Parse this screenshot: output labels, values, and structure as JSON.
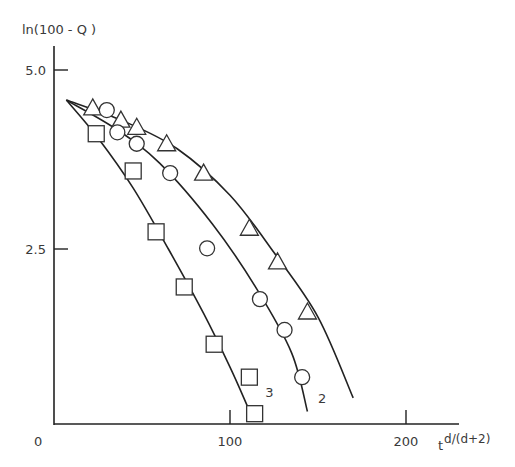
{
  "chart_data": {
    "type": "scatter",
    "title": "",
    "ylabel": "ln(100 - Q )",
    "xlabel": "t",
    "xlabel_superscript": "d/(d+2)",
    "xlim": [
      0,
      230
    ],
    "ylim": [
      0,
      5.3
    ],
    "x_ticks": [
      {
        "value": 0,
        "label": "0"
      },
      {
        "value": 100,
        "label": "100"
      },
      {
        "value": 200,
        "label": "200"
      }
    ],
    "y_ticks": [
      {
        "value": 2.5,
        "label": "2.5"
      },
      {
        "value": 5.0,
        "label": "5.0"
      }
    ],
    "grid": false,
    "legend": "none (curves labeled inline)",
    "series": [
      {
        "name": "1",
        "marker": "triangle",
        "label": "",
        "points": [
          [
            22,
            4.47
          ],
          [
            38,
            4.3
          ],
          [
            47,
            4.2
          ],
          [
            64,
            3.97
          ],
          [
            85,
            3.56
          ],
          [
            111,
            2.79
          ],
          [
            127,
            2.32
          ],
          [
            144,
            1.62
          ]
        ],
        "curve": [
          [
            7,
            4.58
          ],
          [
            40,
            4.28
          ],
          [
            70,
            3.9
          ],
          [
            100,
            3.25
          ],
          [
            125,
            2.45
          ],
          [
            150,
            1.55
          ],
          [
            170,
            0.42
          ]
        ]
      },
      {
        "name": "2",
        "marker": "circle",
        "label": "2",
        "points": [
          [
            30,
            4.44
          ],
          [
            36,
            4.13
          ],
          [
            47,
            3.97
          ],
          [
            66,
            3.56
          ],
          [
            87,
            2.51
          ],
          [
            117,
            1.8
          ],
          [
            131,
            1.37
          ],
          [
            141,
            0.71
          ]
        ],
        "curve": [
          [
            7,
            4.58
          ],
          [
            35,
            4.18
          ],
          [
            60,
            3.7
          ],
          [
            90,
            2.85
          ],
          [
            115,
            1.95
          ],
          [
            135,
            1.05
          ],
          [
            144,
            0.23
          ]
        ]
      },
      {
        "name": "3",
        "marker": "square",
        "label": "3",
        "points": [
          [
            24,
            4.11
          ],
          [
            45,
            3.59
          ],
          [
            58,
            2.74
          ],
          [
            74,
            1.97
          ],
          [
            91,
            1.17
          ],
          [
            111,
            0.71
          ],
          [
            114,
            0.2
          ]
        ],
        "curve": [
          [
            7,
            4.58
          ],
          [
            25,
            4.05
          ],
          [
            45,
            3.35
          ],
          [
            65,
            2.5
          ],
          [
            85,
            1.6
          ],
          [
            100,
            0.85
          ],
          [
            110,
            0.3
          ]
        ]
      }
    ],
    "inline_labels": [
      {
        "text": "3",
        "x": 120,
        "y": 0.43
      },
      {
        "text": "2",
        "x": 150,
        "y": 0.35
      }
    ]
  }
}
